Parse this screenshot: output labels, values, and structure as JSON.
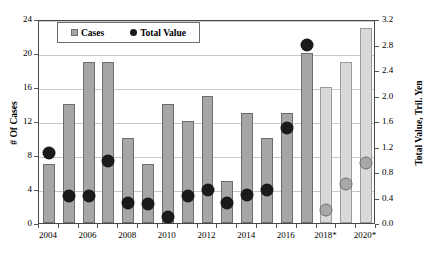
{
  "chart_data": {
    "type": "bar",
    "title": "",
    "xlabel": "",
    "ylabel": "# Of Cases",
    "y2label": "Total Value, Tril. Yen",
    "grid": true,
    "legend_position": "top-left-inside",
    "ylim": [
      0,
      24
    ],
    "y2lim": [
      0.0,
      3.2
    ],
    "yticks": [
      "0",
      "4",
      "8",
      "12",
      "16",
      "20",
      "24"
    ],
    "y2ticks": [
      "0.0",
      "0.4",
      "0.8",
      "1.2",
      "1.6",
      "2.0",
      "2.4",
      "2.8",
      "3.2"
    ],
    "categories": [
      "2004",
      "2005",
      "2006",
      "2007",
      "2008",
      "2009",
      "2010",
      "2011",
      "2012",
      "2013",
      "2014",
      "2015",
      "2016",
      "2017",
      "2018*",
      "2019*",
      "2020*"
    ],
    "xtick_labels": [
      "2004",
      "",
      "2006",
      "",
      "2008",
      "",
      "2010",
      "",
      "2012",
      "",
      "2014",
      "",
      "2016",
      "",
      "2018*",
      "",
      "2020*"
    ],
    "series": [
      {
        "name": "Cases",
        "axis": "left",
        "type": "bar",
        "color": "#a6a6a6",
        "forecast_color": "#d9d9d9",
        "values": [
          7,
          14,
          19,
          19,
          10,
          7,
          14,
          12,
          15,
          5,
          13,
          10,
          13,
          20,
          16,
          19,
          23
        ]
      },
      {
        "name": "Total Value",
        "axis": "right",
        "type": "scatter",
        "color": "#1a1a1a",
        "forecast_color": "#a8a8a8",
        "values": [
          1.2,
          0.52,
          0.52,
          1.08,
          0.42,
          0.4,
          0.2,
          0.52,
          0.62,
          0.42,
          0.54,
          0.62,
          1.6,
          2.9,
          0.3,
          0.72,
          1.05
        ]
      }
    ],
    "forecast_start_index": 14
  },
  "legend": {
    "items": [
      {
        "label": "Cases",
        "marker": "square-marker"
      },
      {
        "label": "Total Value",
        "marker": "circle-marker"
      }
    ]
  }
}
